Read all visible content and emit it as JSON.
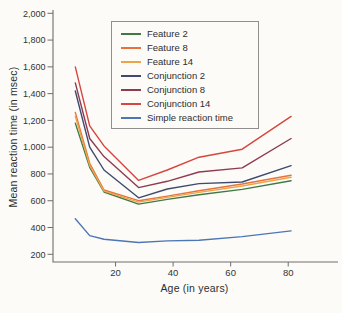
{
  "chart_data": {
    "type": "line",
    "title": "",
    "xlabel": "Age (in years)",
    "ylabel": "Mean reaction time (in msec)",
    "x": [
      6,
      11,
      16,
      28,
      38,
      49,
      64,
      81
    ],
    "x_ticks": [
      20,
      40,
      60,
      80
    ],
    "y_ticks": [
      200,
      400,
      600,
      800,
      1000,
      1200,
      1400,
      1600,
      1800,
      2000
    ],
    "xlim": [
      0,
      98
    ],
    "ylim": [
      200,
      2000
    ],
    "grid": false,
    "legend_position": "top-center-inside",
    "axis_color": "#6e6e6e",
    "tick_label_color": "#333333",
    "series": [
      {
        "name": "Feature 2",
        "color": "#3f7a45",
        "values": [
          1180,
          850,
          665,
          575,
          610,
          645,
          685,
          750
        ]
      },
      {
        "name": "Feature 8",
        "color": "#e8713c",
        "values": [
          1260,
          880,
          680,
          600,
          635,
          675,
          725,
          790
        ]
      },
      {
        "name": "Feature 14",
        "color": "#eca449",
        "values": [
          1230,
          865,
          672,
          590,
          625,
          662,
          710,
          775
        ]
      },
      {
        "name": "Conjunction 2",
        "color": "#3d4b6e",
        "values": [
          1420,
          1000,
          830,
          622,
          688,
          728,
          740,
          862
        ]
      },
      {
        "name": "Conjunction 8",
        "color": "#8e3a53",
        "values": [
          1480,
          1065,
          930,
          698,
          745,
          815,
          845,
          1065
        ]
      },
      {
        "name": "Conjunction 14",
        "color": "#d6463e",
        "values": [
          1600,
          1160,
          1010,
          752,
          830,
          925,
          985,
          1230
        ]
      },
      {
        "name": "Simple reaction time",
        "color": "#4c76b5",
        "values": [
          465,
          340,
          312,
          288,
          300,
          305,
          332,
          375
        ]
      }
    ]
  }
}
